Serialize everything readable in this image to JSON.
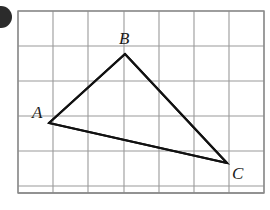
{
  "figure": {
    "type": "geometry-diagram",
    "background_color": "#ffffff",
    "grid": {
      "line_color": "#9a9a9a",
      "line_width": 1.1,
      "border_color": "#8a8a8a",
      "border_width": 1.4,
      "origin_x": 18,
      "origin_y": 11,
      "cell_width": 35.3,
      "cell_height": 35.0,
      "columns": 7,
      "rows": 5.2,
      "right_edge": 265,
      "bottom_edge": 193
    },
    "shape": {
      "name": "triangle-ABC",
      "stroke_color": "#111111",
      "stroke_width": 2.1,
      "fill": "none",
      "vertices": [
        {
          "label": "A",
          "x": 49,
          "y": 123,
          "grid_col": 0.88,
          "grid_row": 3.2
        },
        {
          "label": "B",
          "x": 125,
          "y": 54,
          "grid_col": 3.03,
          "grid_row": 1.23
        },
        {
          "label": "C",
          "x": 227,
          "y": 163,
          "grid_col": 5.92,
          "grid_row": 4.34
        }
      ],
      "edges": [
        {
          "name": "AB",
          "from": "A",
          "to": "B"
        },
        {
          "name": "BC",
          "from": "B",
          "to": "C"
        },
        {
          "name": "CA",
          "from": "C",
          "to": "A"
        }
      ]
    },
    "labels": {
      "A": "A",
      "B": "B",
      "C": "C"
    },
    "corner_mark": {
      "name": "corner-bullet",
      "color": "#2b2b2b",
      "center_x": 1,
      "center_y": 17,
      "radius": 11
    }
  }
}
